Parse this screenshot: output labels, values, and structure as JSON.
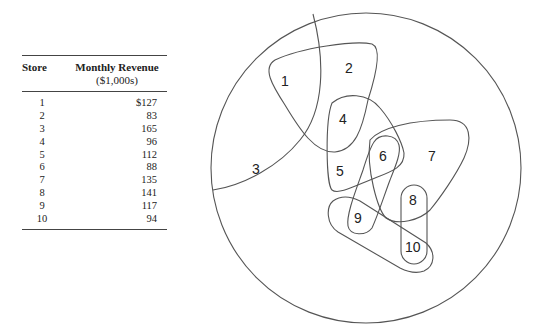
{
  "table": {
    "header": {
      "store": "Store",
      "revenue": "Monthly Revenue",
      "revenue_unit": "($1,000s)"
    },
    "rows": [
      {
        "store": "1",
        "revenue": "$127"
      },
      {
        "store": "2",
        "revenue": "83"
      },
      {
        "store": "3",
        "revenue": "165"
      },
      {
        "store": "4",
        "revenue": "96"
      },
      {
        "store": "5",
        "revenue": "112"
      },
      {
        "store": "6",
        "revenue": "88"
      },
      {
        "store": "7",
        "revenue": "135"
      },
      {
        "store": "8",
        "revenue": "141"
      },
      {
        "store": "9",
        "revenue": "117"
      },
      {
        "store": "10",
        "revenue": "94"
      }
    ]
  },
  "diagram": {
    "regions": [
      "1",
      "2",
      "3",
      "4",
      "5",
      "6",
      "7",
      "8",
      "9",
      "10"
    ],
    "stroke_color": "#555555"
  }
}
